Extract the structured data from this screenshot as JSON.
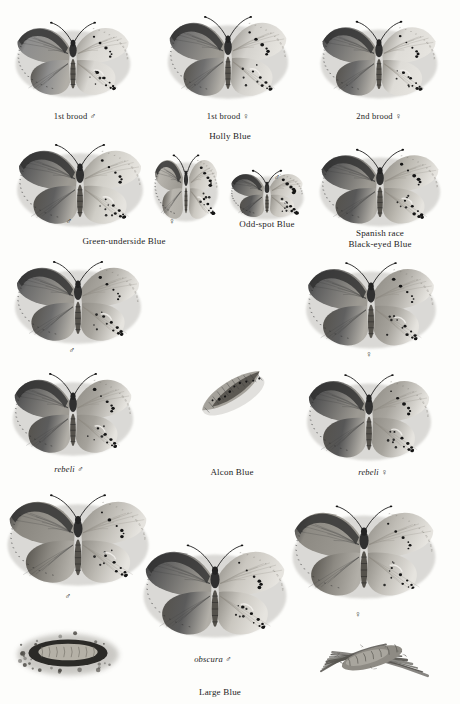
{
  "plate": {
    "kind": "field-guide-specimen-plate",
    "subject": "Blue butterflies (Lycaenidae)",
    "background_color": "#fdfdfb",
    "ink_color": "#232323",
    "rendering": "grayscale halftone specimen paintings, each butterfly shown with left half upperside and right half underside"
  },
  "groups": [
    {
      "id": "holly-blue",
      "label": "Holly Blue",
      "x": 230,
      "y": 131
    },
    {
      "id": "green-underside-blue",
      "label": "Green-underside Blue",
      "x": 124,
      "y": 236
    },
    {
      "id": "odd-spot-blue",
      "label": "Odd-spot Blue",
      "x": 267,
      "y": 219
    },
    {
      "id": "black-eyed-blue",
      "label": "Spanish race\nBlack-eyed Blue",
      "x": 380,
      "y": 228
    },
    {
      "id": "alcon-blue",
      "label": "Alcon Blue",
      "x": 232,
      "y": 467
    },
    {
      "id": "large-blue",
      "label": "Large Blue",
      "x": 220,
      "y": 687
    }
  ],
  "specimens": [
    {
      "id": "holly-blue-1st-brood-male",
      "caption": "1st brood ♂",
      "caption_x": 75,
      "caption_y": 111,
      "x": 73,
      "y": 62,
      "w": 122,
      "h": 84,
      "upper_tone": "#8e8e8e",
      "under_tone": "#d9d7d2",
      "spots": "few, small, underside forewing and hindwing",
      "italic": false
    },
    {
      "id": "holly-blue-1st-brood-female",
      "caption": "1st brood ♀",
      "caption_x": 228,
      "caption_y": 111,
      "x": 228,
      "y": 60,
      "w": 128,
      "h": 92,
      "upper_tone": "#6f6f6f",
      "under_tone": "#d4d2cd",
      "spots": "dark apical border, small underside spots",
      "italic": false
    },
    {
      "id": "holly-blue-2nd-brood-female",
      "caption": "2nd brood ♀",
      "caption_x": 379,
      "caption_y": 111,
      "x": 379,
      "y": 62,
      "w": 124,
      "h": 86,
      "upper_tone": "#6a6a6a",
      "under_tone": "#dedcd7",
      "spots": "dense small black spots on underside",
      "italic": false
    },
    {
      "id": "green-underside-blue-male",
      "caption": "♂",
      "caption_x": 69,
      "caption_y": 216,
      "x": 80,
      "y": 188,
      "w": 134,
      "h": 92,
      "upper_tone": "#5f5f5f",
      "under_tone": "#cfcdc6",
      "spots": "bold round black spots in arcs",
      "italic": false
    },
    {
      "id": "green-underside-blue-female",
      "caption": "♀",
      "caption_x": 172,
      "caption_y": 216,
      "x": 186,
      "y": 190,
      "w": 68,
      "h": 74,
      "upper_tone": "#b8b5ae",
      "under_tone": "#cbc8c1",
      "spots": "bold black spot arcs, underside only",
      "italic": false
    },
    {
      "id": "odd-spot-blue-male",
      "caption": "♂",
      "caption_x": 277,
      "caption_y": 172,
      "x": 267,
      "y": 196,
      "w": 78,
      "h": 54,
      "upper_tone": "#575757",
      "under_tone": "#c9c6bf",
      "spots": "scattered black dots",
      "italic": false
    },
    {
      "id": "black-eyed-blue",
      "caption": "",
      "caption_x": 380,
      "caption_y": 214,
      "x": 380,
      "y": 190,
      "w": 128,
      "h": 86,
      "upper_tone": "#585858",
      "under_tone": "#b9b6ae",
      "spots": "heavy black eyespot rows on underside",
      "italic": false
    },
    {
      "id": "alcon-blue-male",
      "caption": "♂",
      "caption_x": 72,
      "caption_y": 345,
      "x": 78,
      "y": 305,
      "w": 134,
      "h": 92,
      "upper_tone": "#6b6b6b",
      "under_tone": "#a9a69f",
      "spots": "two rows of black dots on underside",
      "italic": false
    },
    {
      "id": "alcon-blue-female",
      "caption": "♀",
      "caption_x": 369,
      "caption_y": 349,
      "x": 371,
      "y": 308,
      "w": 138,
      "h": 96,
      "upper_tone": "#606060",
      "under_tone": "#a5a29b",
      "spots": "dense black dot rows on underside",
      "italic": false
    },
    {
      "id": "alcon-blue-rebeli-male",
      "caption": "rebeli ♂",
      "caption_x": 69,
      "caption_y": 464,
      "x": 73,
      "y": 417,
      "w": 128,
      "h": 92,
      "upper_tone": "#5c5c5c",
      "under_tone": "#a6a39c",
      "spots": "black dot rows, pale lunule on hindwing",
      "italic": true
    },
    {
      "id": "alcon-blue-folded-wing",
      "caption": "",
      "caption_x": 232,
      "caption_y": 455,
      "x": 232,
      "y": 393,
      "w": 86,
      "h": 66,
      "upper_tone": "#9a978f",
      "under_tone": "#7d7a73",
      "spots": "folded resting specimen, diagonal",
      "italic": false
    },
    {
      "id": "alcon-blue-rebeli-female",
      "caption": "rebeli ♀",
      "caption_x": 373,
      "caption_y": 467,
      "x": 369,
      "y": 420,
      "w": 132,
      "h": 96,
      "upper_tone": "#575757",
      "under_tone": "#a7a49d",
      "spots": "heavy black dots on underside",
      "italic": true
    },
    {
      "id": "large-blue-male",
      "caption": "♂",
      "caption_x": 68,
      "caption_y": 591,
      "x": 78,
      "y": 543,
      "w": 150,
      "h": 102,
      "upper_tone": "#8a8780",
      "under_tone": "#bab7b0",
      "spots": "black wedge spots on upperside, dotted underside",
      "italic": false
    },
    {
      "id": "large-blue-obscura-male",
      "caption": "obscura ♂",
      "caption_x": 213,
      "caption_y": 654,
      "x": 215,
      "y": 594,
      "w": 152,
      "h": 104,
      "upper_tone": "#5b5b5b",
      "under_tone": "#cac7c0",
      "spots": "darkened upperside, bold black underside dots",
      "italic": true
    },
    {
      "id": "large-blue-female",
      "caption": "♀",
      "caption_x": 358,
      "caption_y": 609,
      "x": 364,
      "y": 555,
      "w": 152,
      "h": 104,
      "upper_tone": "#8d8a83",
      "under_tone": "#bebbb4",
      "spots": "large black wedges and underside dot rows",
      "italic": false
    },
    {
      "id": "large-blue-larva",
      "caption": "",
      "caption_x": 68,
      "caption_y": 690,
      "x": 68,
      "y": 652,
      "w": 110,
      "h": 52,
      "upper_tone": "#6e6b64",
      "under_tone": "#a8a59e",
      "spots": "larva in ant nest chamber, surrounded by soil",
      "italic": false
    },
    {
      "id": "large-blue-pupa",
      "caption": "",
      "caption_x": 372,
      "caption_y": 690,
      "x": 372,
      "y": 659,
      "w": 116,
      "h": 56,
      "upper_tone": "#6b6861",
      "under_tone": "#9d9a93",
      "spots": "pupa amongst grass blades",
      "italic": false
    }
  ]
}
